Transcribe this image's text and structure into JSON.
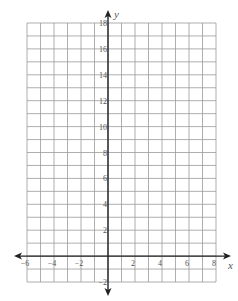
{
  "chart_data": {
    "type": "scatter",
    "title": "",
    "xlabel": "x",
    "ylabel": "y",
    "xlim": [
      -6,
      8
    ],
    "ylim": [
      -2,
      18
    ],
    "grid": true,
    "grid_step": 1,
    "x_ticks": [
      -6,
      -4,
      -2,
      2,
      4,
      6,
      8
    ],
    "x_tick_labels": [
      "−6",
      "−4",
      "−2",
      "2",
      "4",
      "6",
      "8"
    ],
    "y_ticks": [
      -2,
      2,
      4,
      6,
      8,
      10,
      12,
      14,
      16,
      18
    ],
    "y_tick_labels": [
      "−2",
      "2",
      "4",
      "6",
      "8",
      "10",
      "12",
      "14",
      "16",
      "18"
    ],
    "series": [],
    "legend": null
  },
  "colors": {
    "grid": "#9a9a9a",
    "axis": "#222222",
    "label": "#555555"
  }
}
